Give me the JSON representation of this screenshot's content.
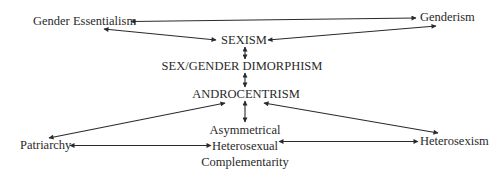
{
  "diagram": {
    "colors": {
      "text": "#2a2a2a",
      "arrow": "#2a2a2a",
      "background": "#ffffff"
    },
    "nodes": {
      "gender_essentialism": "Gender Essentialism",
      "genderism": "Genderism",
      "sexism": "SEXISM",
      "sex_gender_dimorphism": "SEX/GENDER DIMORPHISM",
      "androcentrism": "ANDROCENTRISM",
      "asymmetrical": {
        "line1": "Asymmetrical",
        "line2": "Heterosexual",
        "line3": "Complementarity"
      },
      "patriarchy": "Patriarchy",
      "heterosexism": "Heterosexism"
    },
    "edges": [
      {
        "from": "Gender Essentialism",
        "to": "Genderism",
        "type": "bidirectional"
      },
      {
        "from": "Gender Essentialism",
        "to": "SEXISM",
        "type": "bidirectional"
      },
      {
        "from": "Genderism",
        "to": "SEXISM",
        "type": "bidirectional"
      },
      {
        "from": "SEXISM",
        "to": "SEX/GENDER DIMORPHISM",
        "type": "bidirectional"
      },
      {
        "from": "SEX/GENDER DIMORPHISM",
        "to": "ANDROCENTRISM",
        "type": "bidirectional"
      },
      {
        "from": "ANDROCENTRISM",
        "to": "Patriarchy",
        "type": "bidirectional"
      },
      {
        "from": "ANDROCENTRISM",
        "to": "Heterosexism",
        "type": "bidirectional"
      },
      {
        "from": "ANDROCENTRISM",
        "to": "Asymmetrical Heterosexual Complementarity",
        "type": "bidirectional"
      },
      {
        "from": "Patriarchy",
        "to": "Asymmetrical Heterosexual Complementarity",
        "type": "bidirectional"
      },
      {
        "from": "Heterosexism",
        "to": "Asymmetrical Heterosexual Complementarity",
        "type": "bidirectional"
      }
    ]
  }
}
